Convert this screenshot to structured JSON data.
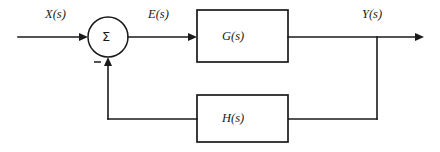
{
  "diagram": {
    "background_color": "#ffffff",
    "line_color": "#1a1a1a",
    "signals": {
      "input": "X(s)",
      "error": "E(s)",
      "output": "Y(s)"
    },
    "summing_junction": {
      "symbol": "Σ",
      "feedback_sign": "−"
    },
    "blocks": [
      {
        "label": "G(s)",
        "role": "forward-path-transfer-function"
      },
      {
        "label": "H(s)",
        "role": "feedback-path-transfer-function"
      }
    ]
  }
}
